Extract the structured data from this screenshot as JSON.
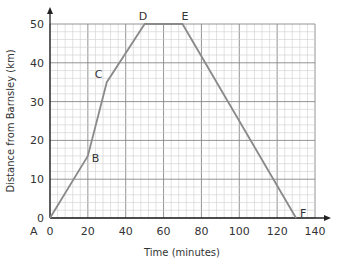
{
  "chart_data": {
    "type": "line",
    "title": "",
    "xlabel": "Time (minutes)",
    "ylabel": "Distance from Barnsley (km)",
    "xlim": [
      0,
      140
    ],
    "ylim": [
      0,
      50
    ],
    "xticks": [
      0,
      20,
      40,
      60,
      80,
      100,
      120,
      140
    ],
    "yticks": [
      0,
      10,
      20,
      30,
      40,
      50
    ],
    "grid": true,
    "series": [
      {
        "name": "journey",
        "x": [
          0,
          20,
          30,
          50,
          70,
          130
        ],
        "y": [
          0,
          16,
          35,
          50,
          50,
          0
        ]
      }
    ],
    "point_labels": [
      "A",
      "B",
      "C",
      "D",
      "E",
      "F"
    ],
    "line_color": "#8a8a8a"
  }
}
